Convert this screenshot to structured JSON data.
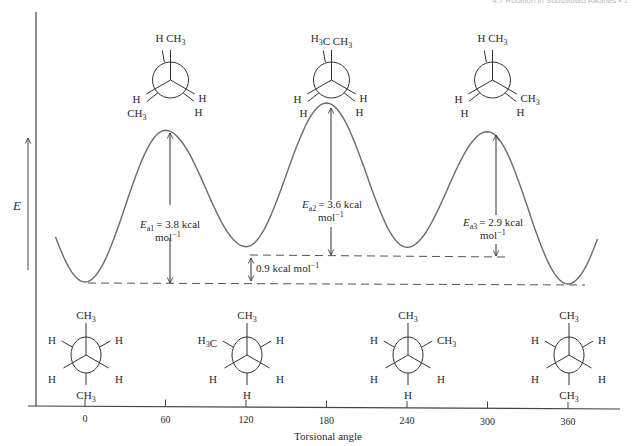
{
  "page_header": "4.7 Rotation in Substituted Alkanes  •  1",
  "chart_data": {
    "type": "line",
    "title": "",
    "xlabel": "Torsional angle",
    "ylabel": "E",
    "x_ticks": [
      0,
      60,
      120,
      180,
      240,
      300,
      360
    ],
    "xlim": [
      -10,
      375
    ],
    "grid": false,
    "legend": null,
    "series": [
      {
        "name": "Potential energy",
        "x": [
          0,
          60,
          120,
          180,
          240,
          300,
          360
        ],
        "values": [
          0.0,
          3.8,
          0.9,
          4.5,
          0.9,
          3.8,
          0.0
        ],
        "units": "kcal mol^-1 (relative)"
      }
    ],
    "annotations": [
      {
        "label_main": "E",
        "label_sub": "a1",
        "label_value": "= 3.8 kcal",
        "label_unit": "mol",
        "label_sup": "−1",
        "x": 60,
        "from": 0.0,
        "to": 3.8
      },
      {
        "label_main": "E",
        "label_sub": "a2",
        "label_value": "= 3.6 kcal",
        "label_unit": "mol",
        "label_sup": "−1",
        "x": 180,
        "from": 0.9,
        "to": 4.5
      },
      {
        "label_main": "E",
        "label_sub": "a3",
        "label_value": "= 2.9 kcal",
        "label_unit": "mol",
        "label_sup": "−1",
        "x": 300,
        "from": 0.9,
        "to": 3.8
      },
      {
        "label": "0.9 kcal mol",
        "label_sup": "−1",
        "x": 120,
        "from": 0.0,
        "to": 0.9
      }
    ],
    "reference_lines": [
      {
        "style": "dashed",
        "y": 0.0,
        "label": "anti minimum"
      },
      {
        "style": "dashed",
        "y": 0.9,
        "label": "gauche minimum"
      }
    ]
  },
  "newman_projections": {
    "eclipsed": [
      {
        "angle": 60,
        "front": [
          "CH3",
          "H",
          "H"
        ],
        "back_labels": [
          "H",
          "CH3",
          "H"
        ],
        "text_top": "H CH3",
        "text_left": "H",
        "text_left2": "CH3",
        "text_right": "H",
        "text_right2": "H"
      },
      {
        "angle": 180,
        "text_top": "H3C CH3",
        "text_left": "H",
        "text_left2": "H",
        "text_right": "H",
        "text_right2": "H"
      },
      {
        "angle": 300,
        "text_top": "H CH3",
        "text_left": "H",
        "text_left2": "H",
        "text_right": "CH3",
        "text_right2": "H"
      }
    ],
    "staggered": [
      {
        "angle": 0,
        "top": "CH3",
        "bottom": "CH3",
        "upper_left": "H",
        "upper_right": "H",
        "lower_left": "H",
        "lower_right": "H"
      },
      {
        "angle": 120,
        "top": "CH3",
        "bottom": "H",
        "upper_left": "H3C",
        "upper_right": "H",
        "lower_left": "H",
        "lower_right": "H"
      },
      {
        "angle": 240,
        "top": "CH3",
        "bottom": "H",
        "upper_left": "H",
        "upper_right": "CH3",
        "lower_left": "H",
        "lower_right": "H"
      },
      {
        "angle": 360,
        "top": "CH3",
        "bottom": "CH3",
        "upper_left": "H",
        "upper_right": "H",
        "lower_left": "H",
        "lower_right": "H"
      }
    ]
  },
  "colors": {
    "curve": "#6b6b6b",
    "ink": "#2a2a2a",
    "axis": "#444444"
  }
}
